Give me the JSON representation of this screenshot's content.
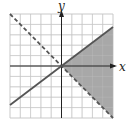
{
  "chart_data": {
    "type": "line",
    "title": "",
    "xlabel": "x",
    "ylabel": "y",
    "xlim": [
      -5,
      5
    ],
    "ylim": [
      -5,
      5
    ],
    "grid": true,
    "grid_step": 1,
    "series": [
      {
        "name": "boundary-solid",
        "equation": "y = 3/4 x",
        "style": "solid",
        "x": [
          -5,
          5
        ],
        "y": [
          -3.75,
          3.75
        ]
      },
      {
        "name": "boundary-dashed",
        "equation": "y = -x",
        "style": "dashed",
        "x": [
          -5,
          5
        ],
        "y": [
          5,
          -5
        ]
      }
    ],
    "shaded_region": {
      "description": "y <= 3/4 x and y > -x",
      "vertices": [
        [
          0,
          0
        ],
        [
          5,
          3.75
        ],
        [
          5,
          -5
        ]
      ]
    }
  },
  "labels": {
    "x_axis": "x",
    "y_axis": "y"
  },
  "colors": {
    "shade": "#a8a8a8",
    "grid": "#c8c8c8",
    "axis": "#222222",
    "line": "#555555"
  }
}
